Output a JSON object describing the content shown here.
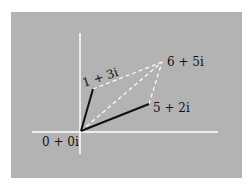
{
  "diagram": {
    "background_color": "#b3b3b3",
    "axis_color": "#ffffff",
    "solid_vector_color": "#111111",
    "dashed_line_color": "#ffffff",
    "points": [
      {
        "label": "0 + 0i",
        "x": 81,
        "y": 131
      },
      {
        "label": "1 + 3i",
        "x": 93,
        "y": 89
      },
      {
        "label": "5 + 2i",
        "x": 149,
        "y": 104
      },
      {
        "label": "6 + 5i",
        "x": 162,
        "y": 62
      }
    ],
    "labels": {
      "origin": "0 + 0i",
      "z1": "1 + 3i",
      "z2": "5 + 2i",
      "sum": "6 + 5i"
    }
  }
}
